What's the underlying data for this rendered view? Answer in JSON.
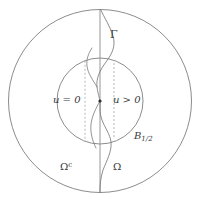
{
  "figure": {
    "type": "mathematical-diagram",
    "background_color": "#ffffff",
    "stroke_color": "#6f6f6f",
    "curve_color": "#7a7a7a",
    "dash_color": "#9a9a9a",
    "label_color": "#3a3a3a",
    "geometry": {
      "center": {
        "x": 100,
        "y": 101
      },
      "outer_circle_radius": 92,
      "inner_circle_radius": 43,
      "vertical_axis_x": 100,
      "dashed_line_left_x": 85,
      "dashed_line_right_x": 114,
      "center_dot_radius": 1.6
    },
    "labels": {
      "gamma": "Γ",
      "u_equals_zero": "u = 0",
      "u_greater_zero": "u > 0",
      "ball_base": "B",
      "ball_subscript": "1/2",
      "omega_complement_base": "Ω",
      "omega_complement_superscript": "c",
      "omega": "Ω"
    },
    "elements": {
      "outer_circle_name": "outer-boundary-circle",
      "inner_circle_name": "inner-ball-circle",
      "vertical_line_name": "vertical-axis-line",
      "free_boundary_name": "free-boundary-curve",
      "dashed_left_name": "dashed-guide-line-left",
      "dashed_right_name": "dashed-guide-line-right",
      "origin_dot_name": "origin-point"
    }
  }
}
